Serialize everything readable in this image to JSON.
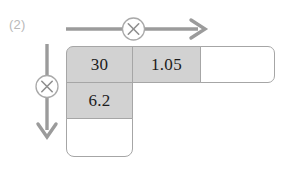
{
  "problem": {
    "number_label": "(2)"
  },
  "operators": {
    "horizontal": {
      "symbol": "×",
      "icon_name": "multiply-circle-icon",
      "direction": "right"
    },
    "vertical": {
      "symbol": "×",
      "icon_name": "multiply-circle-icon",
      "direction": "down"
    }
  },
  "grid": {
    "rows": [
      {
        "cells": [
          {
            "value": "30",
            "filled": true,
            "name": "cell-multiplicand"
          },
          {
            "value": "1.05",
            "filled": true,
            "name": "cell-multiplier"
          },
          {
            "value": "",
            "filled": false,
            "name": "cell-answer-row1"
          }
        ]
      },
      {
        "cells": [
          {
            "value": "6.2",
            "filled": true,
            "name": "cell-multiplier-vertical"
          }
        ]
      },
      {
        "cells": [
          {
            "value": "",
            "filled": false,
            "name": "cell-answer-column1"
          }
        ]
      }
    ]
  },
  "colors": {
    "fill_gray": "#d2d2d2",
    "border_gray": "#a6a6a6",
    "arrow_gray": "#9b9b9b",
    "label_gray": "#b9b9b9",
    "text_black": "#1c1c1c"
  }
}
